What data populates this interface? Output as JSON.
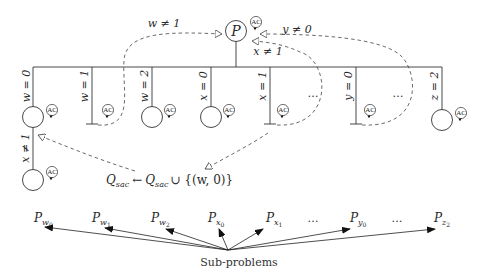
{
  "root": {
    "label": "P",
    "badge": "AC",
    "x": 236,
    "y": 31
  },
  "bar": {
    "y": 67,
    "x1": 33,
    "x2": 442
  },
  "branches": [
    {
      "label": "w = 0",
      "x": 33,
      "leaf": "circle",
      "badge": "AC"
    },
    {
      "label": "w = 1",
      "x": 92,
      "leaf": "bottom",
      "badge": "AC"
    },
    {
      "label": "w = 2",
      "x": 152,
      "leaf": "circle",
      "badge": "AC"
    },
    {
      "label": "x = 0",
      "x": 211,
      "leaf": "circle",
      "badge": "AC"
    },
    {
      "label": "x = 1",
      "x": 270,
      "leaf": "bottom",
      "badge": "AC"
    },
    {
      "label": "y = 0",
      "x": 356,
      "leaf": "bottom",
      "badge": "AC"
    },
    {
      "label": "z = 2",
      "x": 442,
      "leaf": "circle",
      "badge": "AC"
    }
  ],
  "ellipses": [
    {
      "text": "…",
      "x": 313,
      "y": 97
    },
    {
      "text": "…",
      "x": 398,
      "y": 97
    }
  ],
  "second_level": {
    "label": "x ≠ 1",
    "x": 33,
    "badge": "AC"
  },
  "feedback_arrows": [
    {
      "label": "w ≠ 1",
      "from": "w=1 leaf",
      "to": "P"
    },
    {
      "label": "x ≠ 1",
      "from": "x=1 leaf",
      "to": "P"
    },
    {
      "label": "y ≠ 0",
      "from": "y=0 leaf",
      "to": "P"
    }
  ],
  "update_label": {
    "lhs": "Q",
    "lhs_sub": "sac",
    "arrow": "←",
    "rhs": "Q",
    "rhs_sub": "sac",
    "union": "∪ {(w, 0)}"
  },
  "subproblems": {
    "caption": "Sub-problems",
    "labels": [
      {
        "base": "P",
        "sub": "w",
        "subsub": "0",
        "x": 40
      },
      {
        "base": "P",
        "sub": "w",
        "subsub": "1",
        "x": 98
      },
      {
        "base": "P",
        "sub": "w",
        "subsub": "2",
        "x": 157
      },
      {
        "base": "P",
        "sub": "x",
        "subsub": "0",
        "x": 215
      },
      {
        "base": "P",
        "sub": "x",
        "subsub": "1",
        "x": 272
      },
      {
        "base": "…",
        "x": 313
      },
      {
        "base": "P",
        "sub": "y",
        "subsub": "0",
        "x": 357
      },
      {
        "base": "…",
        "x": 397
      },
      {
        "base": "P",
        "sub": "z",
        "subsub": "2",
        "x": 440
      }
    ]
  },
  "colors": {
    "line": "#333333",
    "dash": "#444444",
    "text": "#2a2a2a"
  }
}
